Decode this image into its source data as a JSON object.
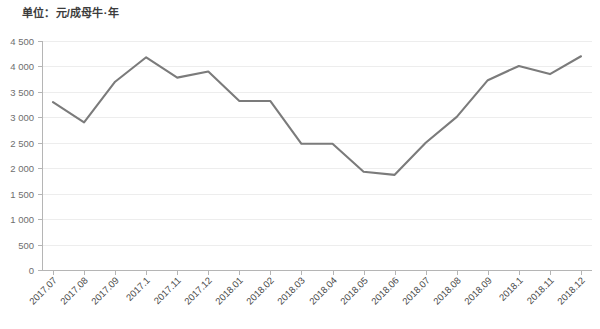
{
  "unit_label": "单位：元/成母牛·年",
  "colors": {
    "line": "#7b7b7b",
    "grid": "#ededed",
    "axis": "#b5b5b5",
    "tick_text": "#6e6e6e",
    "xtick_text": "#4a4a4a",
    "background": "#ffffff"
  },
  "chart_data": {
    "type": "line",
    "title": "",
    "subtitle": "",
    "xlabel": "",
    "ylabel": "单位：元/成母牛·年",
    "categories": [
      "2017.07",
      "2017.08",
      "2017.09",
      "2017.1",
      "2017.11",
      "2017.12",
      "2018.01",
      "2018.02",
      "2018.03",
      "2018.04",
      "2018.05",
      "2018.06",
      "2018.07",
      "2018.08",
      "2018.09",
      "2018.1",
      "2018.11",
      "2018.12"
    ],
    "values": [
      3300,
      2900,
      3700,
      4180,
      3780,
      3900,
      3320,
      3320,
      2480,
      2480,
      1930,
      1870,
      2500,
      3010,
      3730,
      4010,
      3850,
      4200
    ],
    "series": [
      {
        "name": "元/成母牛·年",
        "values": [
          3300,
          2900,
          3700,
          4180,
          3780,
          3900,
          3320,
          3320,
          2480,
          2480,
          1930,
          1870,
          2500,
          3010,
          3730,
          4010,
          3850,
          4200
        ]
      }
    ],
    "ylim": [
      0,
      4500
    ],
    "ytick_values": [
      0,
      500,
      1000,
      1500,
      2000,
      2500,
      3000,
      3500,
      4000,
      4500
    ],
    "ytick_labels": [
      "0",
      "500",
      "1 000",
      "1 500",
      "2 000",
      "2 500",
      "3 000",
      "3 500",
      "4 000",
      "4 500"
    ],
    "grid": true,
    "grid_axis": "y",
    "legend": false,
    "legend_position": "none",
    "xtick_rotation": -45,
    "annotations": []
  }
}
